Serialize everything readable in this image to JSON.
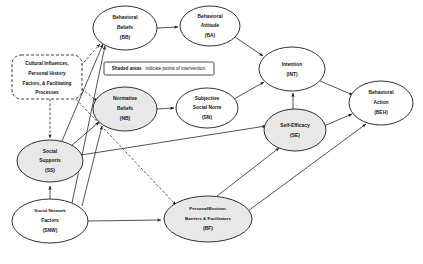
{
  "diagram": {
    "background_color": "#ffffff",
    "line_color": "#1a1a1a",
    "shade_color": "#e8e8e8",
    "legend": {
      "emphasis": "Shaded areas",
      "rest": "indicate points of intervention."
    },
    "context_box": {
      "line1": "Cultural Influences,",
      "line2": "Personal History",
      "line3": "Factors, & Facilitating",
      "line4": "Processes"
    },
    "nodes": [
      {
        "id": "BB",
        "line1": "Behavioral",
        "line2": "Beliefs",
        "line3": "(BB)",
        "cx": 125,
        "cy": 28,
        "rx": 32,
        "ry": 22,
        "shaded": false
      },
      {
        "id": "BA",
        "line1": "Behavioral",
        "line2": "Attitude",
        "line3": "(BA)",
        "cx": 210,
        "cy": 26,
        "rx": 30,
        "ry": 20,
        "shaded": false
      },
      {
        "id": "NB",
        "line1": "Normative",
        "line2": "Beliefs",
        "line3": "(NB)",
        "cx": 125,
        "cy": 109,
        "rx": 32,
        "ry": 22,
        "shaded": true
      },
      {
        "id": "SN",
        "line1": "Subjective",
        "line2": "Social Norm",
        "line3": "(SN)",
        "cx": 207,
        "cy": 108,
        "rx": 31,
        "ry": 20,
        "shaded": false
      },
      {
        "id": "INT",
        "line1": "Intention",
        "line2": "(INT)",
        "line3": "",
        "cx": 292,
        "cy": 69,
        "rx": 33,
        "ry": 22,
        "shaded": false
      },
      {
        "id": "SE",
        "line1": "Self-Efficacy",
        "line2": "(SE)",
        "line3": "",
        "cx": 295,
        "cy": 130,
        "rx": 31,
        "ry": 21,
        "shaded": true
      },
      {
        "id": "BEH",
        "line1": "Behavioral",
        "line2": "Action",
        "line3": "(BEH)",
        "cx": 381,
        "cy": 103,
        "rx": 32,
        "ry": 22,
        "shaded": false
      },
      {
        "id": "SS",
        "line1": "Social",
        "line2": "Supports",
        "line3": "(SS)",
        "cx": 50,
        "cy": 161,
        "rx": 33,
        "ry": 21,
        "shaded": true
      },
      {
        "id": "SNW",
        "line1": "Social Network",
        "line2": "Factors",
        "line3": "(SNW)",
        "cx": 50,
        "cy": 221,
        "rx": 38,
        "ry": 22,
        "shaded": false
      },
      {
        "id": "BF",
        "line1": "Personal/Environ.",
        "line2": "Barriers & Facilitators",
        "line3": "(BF)",
        "cx": 208,
        "cy": 219,
        "rx": 44,
        "ry": 23,
        "shaded": true
      }
    ],
    "edges": [
      {
        "from": "BB",
        "to": "BA",
        "style": "solid"
      },
      {
        "from": "BA",
        "to": "INT",
        "style": "solid"
      },
      {
        "from": "NB",
        "to": "SN",
        "style": "solid"
      },
      {
        "from": "SN",
        "to": "INT",
        "style": "solid"
      },
      {
        "from": "SE",
        "to": "INT",
        "style": "solid"
      },
      {
        "from": "INT",
        "to": "BEH",
        "style": "solid"
      },
      {
        "from": "SE",
        "to": "BEH",
        "style": "solid"
      },
      {
        "from": "BF",
        "to": "BEH",
        "style": "solid"
      },
      {
        "from": "BF",
        "to": "SE",
        "style": "solid"
      },
      {
        "from": "SS",
        "to": "SE",
        "style": "solid"
      },
      {
        "from": "SS",
        "to": "BB",
        "style": "solid"
      },
      {
        "from": "SS",
        "to": "NB",
        "style": "solid"
      },
      {
        "from": "SNW",
        "to": "SS",
        "style": "solid"
      },
      {
        "from": "SNW",
        "to": "BB",
        "style": "solid"
      },
      {
        "from": "SNW",
        "to": "NB",
        "style": "solid"
      },
      {
        "from": "SNW",
        "to": "BF",
        "style": "solid"
      },
      {
        "from": "CONTEXT",
        "to": "BB",
        "style": "dashed"
      },
      {
        "from": "CONTEXT",
        "to": "NB",
        "style": "dashed"
      },
      {
        "from": "CONTEXT",
        "to": "SS",
        "style": "dashed"
      },
      {
        "from": "CONTEXT",
        "to": "BF",
        "style": "dashed"
      }
    ]
  }
}
